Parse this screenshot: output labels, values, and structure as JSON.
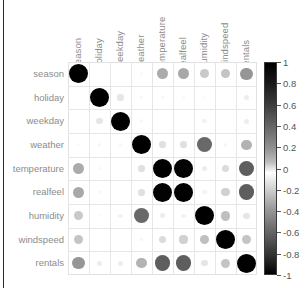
{
  "chart_data": {
    "type": "heatmap",
    "title": "",
    "subtitle": "",
    "xlabel": "",
    "ylabel": "",
    "legend_position": "right",
    "grid": true,
    "marker": "circle",
    "encoding": "circle area and grayscale shade encode correlation; black = +/-1, white = 0",
    "colorbar": {
      "min": -1,
      "max": 1,
      "ticks": [
        "1",
        "0.8",
        "0.6",
        "0.4",
        "0.2",
        "0",
        "-0.2",
        "-0.4",
        "-0.6",
        "-0.8",
        "-1"
      ],
      "tick_values": [
        1,
        0.8,
        0.6,
        0.4,
        0.2,
        0,
        -0.2,
        -0.4,
        -0.6,
        -0.8,
        -1
      ]
    },
    "categories": [
      "season",
      "holiday",
      "weekday",
      "weather",
      "temperature",
      "realfeel",
      "humidity",
      "windspeed",
      "rentals"
    ],
    "x_tick_labels": [
      "season",
      "holiday",
      "weekday",
      "weather",
      "temperature",
      "realfeel",
      "humidity",
      "windspeed",
      "rentals"
    ],
    "y_tick_labels": [
      "season",
      "holiday",
      "weekday",
      "weather",
      "temperature",
      "realfeel",
      "humidity",
      "windspeed",
      "rentals"
    ],
    "matrix": [
      [
        1.0,
        0.01,
        -0.01,
        0.02,
        0.33,
        0.34,
        0.21,
        -0.23,
        0.41
      ],
      [
        0.01,
        1.0,
        -0.1,
        -0.03,
        -0.03,
        -0.03,
        -0.02,
        0.01,
        -0.07
      ],
      [
        -0.01,
        -0.1,
        1.0,
        0.03,
        -0.0,
        -0.01,
        -0.05,
        0.01,
        0.07
      ],
      [
        0.02,
        -0.03,
        0.03,
        1.0,
        -0.12,
        -0.12,
        0.59,
        0.04,
        -0.3
      ],
      [
        0.33,
        -0.03,
        -0.0,
        -0.12,
        1.0,
        0.99,
        -0.07,
        -0.14,
        0.63
      ],
      [
        0.34,
        -0.03,
        -0.01,
        -0.12,
        0.99,
        1.0,
        -0.05,
        -0.18,
        0.63
      ],
      [
        0.21,
        -0.02,
        -0.05,
        0.59,
        -0.07,
        -0.05,
        1.0,
        -0.25,
        -0.1
      ],
      [
        -0.23,
        0.01,
        0.01,
        0.04,
        -0.14,
        -0.18,
        -0.25,
        1.0,
        -0.23
      ],
      [
        0.41,
        -0.07,
        0.07,
        -0.3,
        0.63,
        0.63,
        -0.1,
        -0.23,
        1.0
      ]
    ]
  }
}
